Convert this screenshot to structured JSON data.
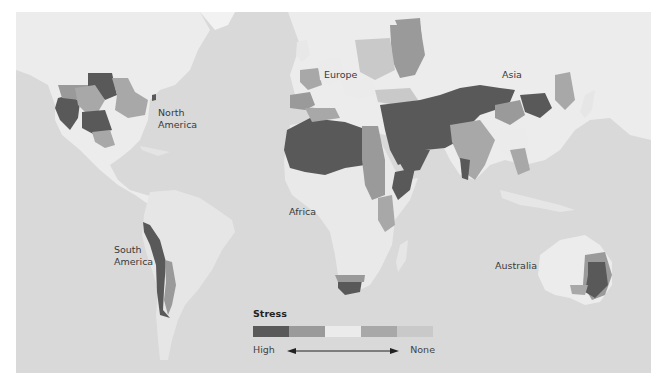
{
  "map": {
    "title_visible": false,
    "ocean_color": "#d9d9d9",
    "land_color": "#ececec",
    "labels": {
      "north_america": "North\nAmerica",
      "north_america_line1": "North",
      "north_america_line2": "America",
      "south_america_line1": "South",
      "south_america_line2": "America",
      "europe": "Europe",
      "asia": "Asia",
      "africa": "Africa",
      "australia": "Australia"
    }
  },
  "legend": {
    "title": "Stress",
    "scale": [
      {
        "level": 1,
        "description": "highest stress",
        "color": "#595959"
      },
      {
        "level": 2,
        "description": "high-medium stress",
        "color": "#9a9a9a"
      },
      {
        "level": 3,
        "description": "medium stress",
        "color": "#ebebeb"
      },
      {
        "level": 4,
        "description": "low stress",
        "color": "#a8a8a8"
      },
      {
        "level": 5,
        "description": "no stress",
        "color": "#c9c9c9"
      }
    ],
    "low_end_label": "High",
    "high_end_label": "None",
    "arrow": "double-headed"
  }
}
